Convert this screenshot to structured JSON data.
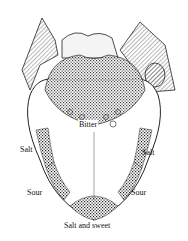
{
  "diagram": {
    "labels": {
      "bitter": "Bitter",
      "salt_left": "Salt",
      "salt_right": "Salt",
      "sour_left": "Sour",
      "sour_right": "Sour",
      "salt_and_sweet": "Salt and sweet"
    }
  }
}
